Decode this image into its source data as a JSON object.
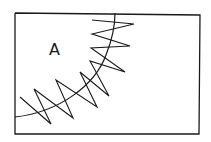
{
  "figure": {
    "label": "A",
    "elements": {
      "frame": "rectangular-border",
      "arc": "curved-boundary-line",
      "zigzag": "helical-coil-along-arc"
    },
    "colors": {
      "line": "#1a1a1a",
      "background": "#ffffff"
    }
  }
}
